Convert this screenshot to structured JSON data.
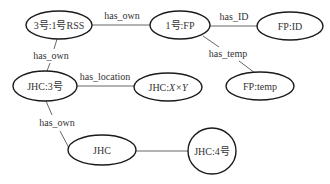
{
  "nodes": [
    {
      "id": "n1",
      "label": "3号:1号RSS",
      "cx": 59,
      "cy": 25,
      "rx": 33,
      "ry": 14
    },
    {
      "id": "n2",
      "label": "1号:FP",
      "cx": 180,
      "cy": 25,
      "rx": 30,
      "ry": 14
    },
    {
      "id": "n3",
      "label": "FP:ID",
      "cx": 290,
      "cy": 26,
      "rx": 33,
      "ry": 14
    },
    {
      "id": "n4",
      "label": "FP:temp",
      "cx": 260,
      "cy": 86,
      "rx": 34,
      "ry": 14
    },
    {
      "id": "n5",
      "label": "JHC:3号",
      "cx": 45,
      "cy": 86,
      "rx": 32,
      "ry": 15
    },
    {
      "id": "n6",
      "label_prefix": "JHC:",
      "label_math": "X×Y",
      "cx": 168,
      "cy": 87,
      "rx": 34,
      "ry": 14
    },
    {
      "id": "n7",
      "label": "JHC",
      "cx": 102,
      "cy": 150,
      "rx": 34,
      "ry": 15
    },
    {
      "id": "n8",
      "label": "JHC:4号",
      "cx": 212,
      "cy": 151,
      "rx": 24,
      "ry": 23
    }
  ],
  "edges": [
    {
      "from": "n1",
      "to": "n2",
      "label": "has_own"
    },
    {
      "from": "n2",
      "to": "n3",
      "label": "has_ID"
    },
    {
      "from": "n2",
      "to": "n4",
      "label": "has_temp"
    },
    {
      "from": "n1",
      "to": "n5",
      "label": "has_own"
    },
    {
      "from": "n5",
      "to": "n6",
      "label": "has_location"
    },
    {
      "from": "n5",
      "to": "n7",
      "label": "has_own"
    },
    {
      "from": "n7",
      "to": "n8",
      "label": ""
    }
  ]
}
